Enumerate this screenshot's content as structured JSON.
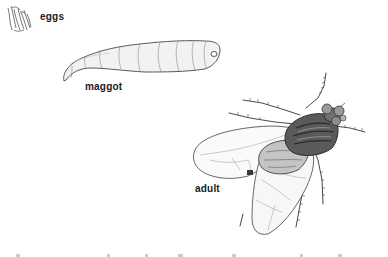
{
  "diagram": {
    "stages": [
      {
        "id": "eggs",
        "label": "eggs"
      },
      {
        "id": "maggot",
        "label": "maggot"
      },
      {
        "id": "adult",
        "label": "adult"
      }
    ]
  },
  "colors": {
    "background": "#ffffff",
    "ink": "#1a1a1a",
    "line": "#555555",
    "shade_dark": "#3a3a3a",
    "shade_mid": "#8a8a8a",
    "shade_light": "#d6d6d6"
  }
}
